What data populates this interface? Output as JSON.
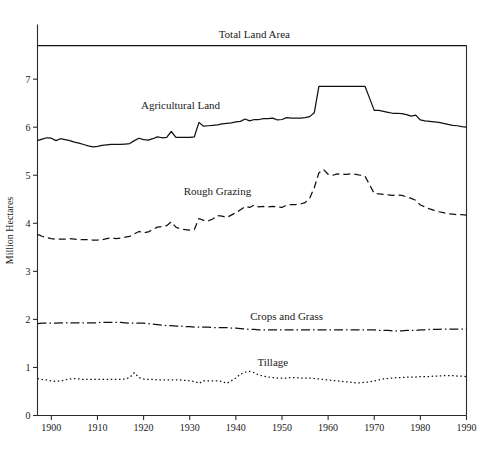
{
  "chart_data": {
    "type": "line",
    "title": "Total Land Area",
    "xlabel": "",
    "ylabel": "Million Hectares",
    "xlim": [
      1897,
      1990
    ],
    "ylim": [
      0,
      7.7
    ],
    "xticks": [
      1900,
      1910,
      1920,
      1930,
      1940,
      1950,
      1960,
      1970,
      1980,
      1990
    ],
    "yticks": [
      0,
      1,
      2,
      3,
      4,
      5,
      6,
      7
    ],
    "grid": false,
    "legend_position": "inline-annotations",
    "annotations": [
      {
        "text": "Total Land Area",
        "x": 1944,
        "y": 7.85
      },
      {
        "text": "Agricultural Land",
        "x": 1928,
        "y": 6.38
      },
      {
        "text": "Rough Grazing",
        "x": 1936,
        "y": 4.58
      },
      {
        "text": "Crops and Grass",
        "x": 1951,
        "y": 1.98
      },
      {
        "text": "Tillage",
        "x": 1948,
        "y": 1.03
      }
    ],
    "x": [
      1897,
      1898,
      1899,
      1900,
      1901,
      1902,
      1903,
      1904,
      1905,
      1906,
      1907,
      1908,
      1909,
      1910,
      1911,
      1912,
      1913,
      1914,
      1915,
      1916,
      1917,
      1918,
      1919,
      1920,
      1921,
      1922,
      1923,
      1924,
      1925,
      1926,
      1927,
      1928,
      1929,
      1930,
      1931,
      1932,
      1933,
      1934,
      1935,
      1936,
      1937,
      1938,
      1939,
      1940,
      1941,
      1942,
      1943,
      1944,
      1945,
      1946,
      1947,
      1948,
      1949,
      1950,
      1951,
      1952,
      1953,
      1954,
      1955,
      1956,
      1957,
      1958,
      1959,
      1960,
      1961,
      1962,
      1963,
      1964,
      1965,
      1966,
      1967,
      1968,
      1969,
      1970,
      1971,
      1972,
      1973,
      1974,
      1975,
      1976,
      1977,
      1978,
      1979,
      1980,
      1981,
      1982,
      1983,
      1984,
      1985,
      1986,
      1987,
      1988,
      1989,
      1990
    ],
    "series": [
      {
        "name": "Total Land Area",
        "style": "solid",
        "constant": true,
        "values": [
          7.7,
          7.7,
          7.7,
          7.7,
          7.7,
          7.7,
          7.7,
          7.7,
          7.7,
          7.7,
          7.7,
          7.7,
          7.7,
          7.7,
          7.7,
          7.7,
          7.7,
          7.7,
          7.7,
          7.7,
          7.7,
          7.7,
          7.7,
          7.7,
          7.7,
          7.7,
          7.7,
          7.7,
          7.7,
          7.7,
          7.7,
          7.7,
          7.7,
          7.7,
          7.7,
          7.7,
          7.7,
          7.7,
          7.7,
          7.7,
          7.7,
          7.7,
          7.7,
          7.7,
          7.7,
          7.7,
          7.7,
          7.7,
          7.7,
          7.7,
          7.7,
          7.7,
          7.7,
          7.7,
          7.7,
          7.7,
          7.7,
          7.7,
          7.7,
          7.7,
          7.7,
          7.7,
          7.7,
          7.7,
          7.7,
          7.7,
          7.7,
          7.7,
          7.7,
          7.7,
          7.7,
          7.7,
          7.7,
          7.7,
          7.7,
          7.7,
          7.7,
          7.7,
          7.7,
          7.7,
          7.7,
          7.7,
          7.7,
          7.7,
          7.7,
          7.7,
          7.7,
          7.7,
          7.7,
          7.7,
          7.7,
          7.7,
          7.7,
          7.7
        ]
      },
      {
        "name": "Agricultural Land",
        "style": "solid",
        "values": [
          5.72,
          5.75,
          5.78,
          5.77,
          5.72,
          5.76,
          5.74,
          5.72,
          5.69,
          5.67,
          5.64,
          5.61,
          5.59,
          5.6,
          5.62,
          5.63,
          5.64,
          5.64,
          5.64,
          5.65,
          5.66,
          5.72,
          5.77,
          5.74,
          5.73,
          5.76,
          5.8,
          5.78,
          5.79,
          5.91,
          5.79,
          5.79,
          5.79,
          5.79,
          5.8,
          6.1,
          6.02,
          6.03,
          6.04,
          6.05,
          6.07,
          6.08,
          6.09,
          6.11,
          6.12,
          6.17,
          6.13,
          6.16,
          6.16,
          6.18,
          6.18,
          6.19,
          6.15,
          6.16,
          6.2,
          6.19,
          6.19,
          6.19,
          6.2,
          6.22,
          6.3,
          6.85,
          6.85,
          6.85,
          6.85,
          6.85,
          6.85,
          6.85,
          6.85,
          6.85,
          6.85,
          6.85,
          6.6,
          6.35,
          6.35,
          6.33,
          6.31,
          6.29,
          6.29,
          6.28,
          6.26,
          6.23,
          6.25,
          6.15,
          6.13,
          6.12,
          6.11,
          6.1,
          6.08,
          6.06,
          6.04,
          6.03,
          6.01,
          6.0
        ]
      },
      {
        "name": "Rough Grazing",
        "style": "dashed",
        "values": [
          3.77,
          3.73,
          3.7,
          3.68,
          3.67,
          3.67,
          3.67,
          3.68,
          3.67,
          3.66,
          3.66,
          3.66,
          3.65,
          3.65,
          3.66,
          3.68,
          3.7,
          3.68,
          3.69,
          3.71,
          3.73,
          3.78,
          3.83,
          3.8,
          3.82,
          3.87,
          3.92,
          3.93,
          3.95,
          4.03,
          3.92,
          3.88,
          3.87,
          3.86,
          3.87,
          4.1,
          4.06,
          4.05,
          4.09,
          4.16,
          4.15,
          4.12,
          4.17,
          4.22,
          4.28,
          4.35,
          4.33,
          4.38,
          4.34,
          4.35,
          4.34,
          4.35,
          4.34,
          4.33,
          4.38,
          4.39,
          4.39,
          4.4,
          4.43,
          4.52,
          4.74,
          5.05,
          5.12,
          5.02,
          5.0,
          5.03,
          5.02,
          5.02,
          5.03,
          5.02,
          5.0,
          4.98,
          4.8,
          4.62,
          4.61,
          4.6,
          4.59,
          4.58,
          4.59,
          4.58,
          4.55,
          4.52,
          4.48,
          4.38,
          4.34,
          4.3,
          4.27,
          4.24,
          4.22,
          4.2,
          4.19,
          4.18,
          4.18,
          4.17
        ]
      },
      {
        "name": "Crops and Grass",
        "style": "dashdot",
        "values": [
          1.91,
          1.92,
          1.92,
          1.92,
          1.92,
          1.93,
          1.93,
          1.93,
          1.93,
          1.93,
          1.93,
          1.93,
          1.93,
          1.93,
          1.94,
          1.94,
          1.94,
          1.94,
          1.94,
          1.93,
          1.92,
          1.92,
          1.92,
          1.92,
          1.91,
          1.9,
          1.89,
          1.88,
          1.87,
          1.87,
          1.86,
          1.86,
          1.85,
          1.85,
          1.84,
          1.84,
          1.84,
          1.84,
          1.83,
          1.83,
          1.83,
          1.83,
          1.82,
          1.82,
          1.81,
          1.8,
          1.79,
          1.79,
          1.78,
          1.78,
          1.78,
          1.78,
          1.78,
          1.78,
          1.78,
          1.78,
          1.78,
          1.78,
          1.78,
          1.78,
          1.78,
          1.78,
          1.78,
          1.78,
          1.78,
          1.78,
          1.78,
          1.78,
          1.78,
          1.78,
          1.78,
          1.78,
          1.78,
          1.78,
          1.77,
          1.77,
          1.77,
          1.76,
          1.76,
          1.76,
          1.77,
          1.77,
          1.77,
          1.78,
          1.78,
          1.79,
          1.79,
          1.79,
          1.8,
          1.8,
          1.8,
          1.8,
          1.8,
          1.8
        ]
      },
      {
        "name": "Tillage",
        "style": "dotted",
        "values": [
          0.77,
          0.75,
          0.74,
          0.72,
          0.71,
          0.72,
          0.74,
          0.76,
          0.77,
          0.76,
          0.75,
          0.75,
          0.75,
          0.75,
          0.75,
          0.75,
          0.75,
          0.75,
          0.75,
          0.76,
          0.79,
          0.89,
          0.79,
          0.76,
          0.75,
          0.75,
          0.74,
          0.74,
          0.74,
          0.74,
          0.74,
          0.74,
          0.73,
          0.72,
          0.71,
          0.67,
          0.72,
          0.72,
          0.72,
          0.72,
          0.71,
          0.67,
          0.72,
          0.78,
          0.86,
          0.9,
          0.92,
          0.89,
          0.84,
          0.82,
          0.8,
          0.79,
          0.78,
          0.78,
          0.78,
          0.79,
          0.79,
          0.78,
          0.78,
          0.78,
          0.77,
          0.76,
          0.75,
          0.74,
          0.73,
          0.72,
          0.71,
          0.7,
          0.69,
          0.68,
          0.68,
          0.69,
          0.7,
          0.72,
          0.74,
          0.76,
          0.77,
          0.78,
          0.79,
          0.79,
          0.8,
          0.8,
          0.8,
          0.81,
          0.81,
          0.81,
          0.82,
          0.82,
          0.83,
          0.83,
          0.83,
          0.82,
          0.82,
          0.81
        ]
      }
    ]
  }
}
